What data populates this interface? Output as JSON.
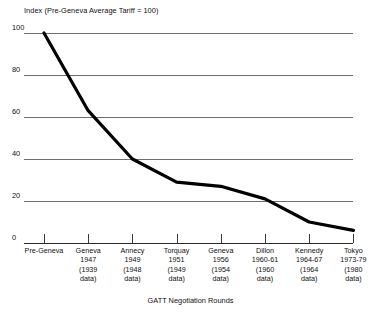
{
  "chart_data": {
    "type": "line",
    "title": "Index (Pre-Geneva Average Tariff = 100)",
    "xlabel": "GATT Negotiation Rounds",
    "ylabel": "",
    "ylim": [
      0,
      100
    ],
    "yticks": [
      100,
      80,
      60,
      40,
      20,
      0
    ],
    "grid": true,
    "legend": "none",
    "categories": [
      "Pre-Geneva",
      "Geneva 1947 (1939 data)",
      "Annecy 1949 (1948 data)",
      "Torquay 1951 (1949 data)",
      "Geneva 1956 (1954 data)",
      "Dillon 1960-61 (1960 data)",
      "Kennedy 1964-67 (1964 data)",
      "Tokyo 1973-79 (1980 data)"
    ],
    "values": [
      100,
      63,
      40,
      29,
      27,
      21,
      10,
      6
    ],
    "line_color": "#000000",
    "grid_color": "#6e6e6e"
  },
  "axis": {
    "title": "Index (Pre-Geneva Average Tariff = 100)",
    "caption": "GATT Negotiation Rounds",
    "yticks": [
      {
        "label": "100"
      },
      {
        "label": "80"
      },
      {
        "label": "60"
      },
      {
        "label": "40"
      },
      {
        "label": "20"
      },
      {
        "label": "0"
      }
    ]
  },
  "categories": [
    {
      "name": "Pre-Geneva",
      "lines": [
        "Pre-Geneva"
      ]
    },
    {
      "name": "Geneva 1947",
      "lines": [
        "Geneva",
        "1947",
        "(1939",
        "data)"
      ]
    },
    {
      "name": "Annecy 1949",
      "lines": [
        "Annecy",
        "1949",
        "(1948",
        "data)"
      ]
    },
    {
      "name": "Torquay 1951",
      "lines": [
        "Torquay",
        "1951",
        "(1949",
        "data)"
      ]
    },
    {
      "name": "Geneva 1956",
      "lines": [
        "Geneva",
        "1956",
        "(1954",
        "data)"
      ]
    },
    {
      "name": "Dillon 1960-61",
      "lines": [
        "Dillon",
        "1960-61",
        "(1960",
        "data)"
      ]
    },
    {
      "name": "Kennedy 1964-67",
      "lines": [
        "Kennedy",
        "1964-67",
        "(1964",
        "data)"
      ]
    },
    {
      "name": "Tokyo 1973-79",
      "lines": [
        "Tokyo",
        "1973-79",
        "(1980",
        "data)"
      ]
    }
  ]
}
